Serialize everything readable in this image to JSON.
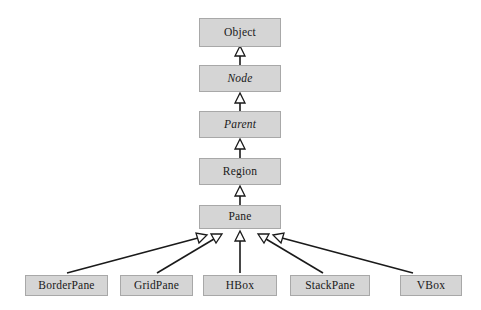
{
  "diagram": {
    "type": "class-hierarchy",
    "background_color": "#ffffff",
    "box_fill_color": "#d5d5d5",
    "box_border_color": "#a8a8a8",
    "edge_color": "#1a1a1a",
    "arrow_style": "hollow-triangle-generalization",
    "nodes": [
      {
        "id": "object",
        "label": "Object",
        "abstract": false,
        "x": 199,
        "y": 18,
        "w": 82,
        "h": 29
      },
      {
        "id": "node",
        "label": "Node",
        "abstract": true,
        "x": 199,
        "y": 65,
        "w": 82,
        "h": 27
      },
      {
        "id": "parent",
        "label": "Parent",
        "abstract": true,
        "x": 199,
        "y": 111,
        "w": 82,
        "h": 27
      },
      {
        "id": "region",
        "label": "Region",
        "abstract": false,
        "x": 199,
        "y": 158,
        "w": 82,
        "h": 27
      },
      {
        "id": "pane",
        "label": "Pane",
        "abstract": false,
        "x": 199,
        "y": 205,
        "w": 82,
        "h": 24
      },
      {
        "id": "borderpane",
        "label": "BorderPane",
        "abstract": false,
        "x": 25,
        "y": 275,
        "w": 83,
        "h": 21
      },
      {
        "id": "gridpane",
        "label": "GridPane",
        "abstract": false,
        "x": 120,
        "y": 275,
        "w": 73,
        "h": 21
      },
      {
        "id": "hbox",
        "label": "HBox",
        "abstract": false,
        "x": 203,
        "y": 275,
        "w": 74,
        "h": 21
      },
      {
        "id": "stackpane",
        "label": "StackPane",
        "abstract": false,
        "x": 290,
        "y": 275,
        "w": 80,
        "h": 21
      },
      {
        "id": "vbox",
        "label": "VBox",
        "abstract": false,
        "x": 400,
        "y": 275,
        "w": 62,
        "h": 21
      }
    ],
    "edges": [
      {
        "from": "node",
        "to": "object",
        "kind": "generalization"
      },
      {
        "from": "parent",
        "to": "node",
        "kind": "generalization"
      },
      {
        "from": "region",
        "to": "parent",
        "kind": "generalization"
      },
      {
        "from": "pane",
        "to": "region",
        "kind": "generalization"
      },
      {
        "from": "borderpane",
        "to": "pane",
        "kind": "generalization"
      },
      {
        "from": "gridpane",
        "to": "pane",
        "kind": "generalization"
      },
      {
        "from": "hbox",
        "to": "pane",
        "kind": "generalization"
      },
      {
        "from": "stackpane",
        "to": "pane",
        "kind": "generalization"
      },
      {
        "from": "vbox",
        "to": "pane",
        "kind": "generalization"
      }
    ]
  }
}
